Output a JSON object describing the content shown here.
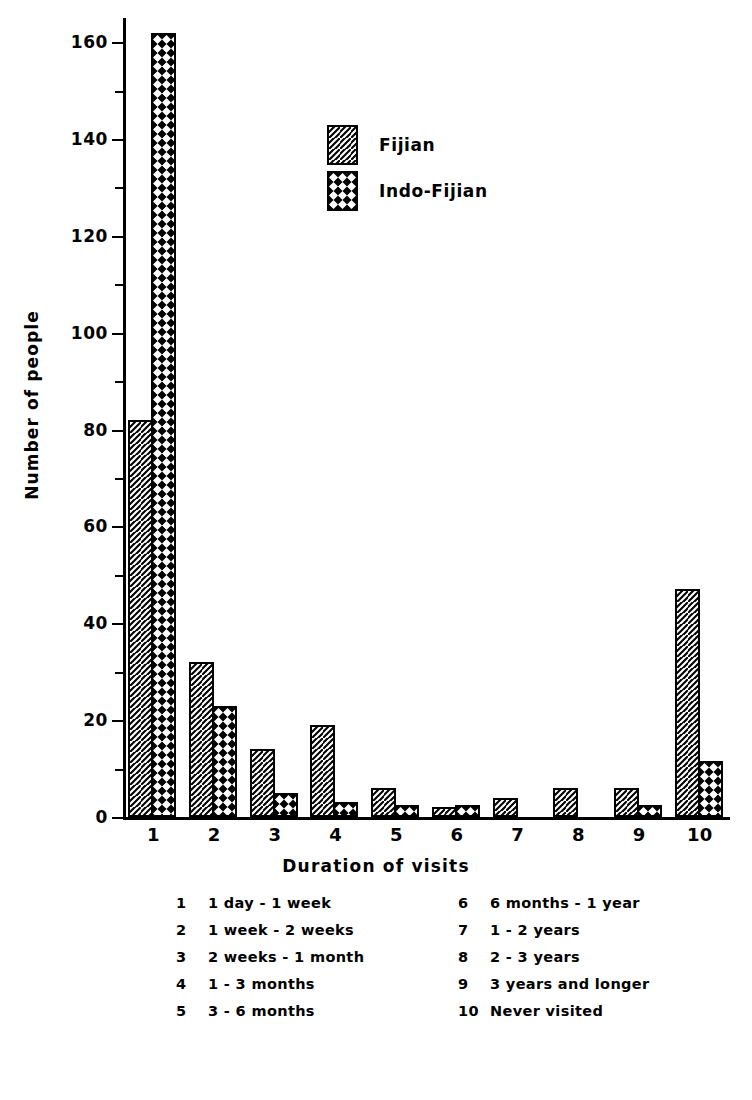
{
  "chart_data": {
    "type": "bar",
    "title": "",
    "xlabel": "Duration of visits",
    "ylabel": "Number of people",
    "categories": [
      "1",
      "2",
      "3",
      "4",
      "5",
      "6",
      "7",
      "8",
      "9",
      "10"
    ],
    "ylim": [
      0,
      165
    ],
    "ytick_labels": [
      "0",
      "20",
      "40",
      "60",
      "80",
      "100",
      "120",
      "140",
      "160"
    ],
    "ytick_values": [
      0,
      20,
      40,
      60,
      80,
      100,
      120,
      140,
      160
    ],
    "yminor_values": [
      10,
      30,
      50,
      70,
      90,
      110,
      130,
      150
    ],
    "grid": false,
    "legend_position": "upper-center",
    "series": [
      {
        "name": "Fijian",
        "values": [
          82,
          32,
          14,
          19,
          6,
          2,
          4,
          6,
          6,
          47
        ]
      },
      {
        "name": "Indo-Fijian",
        "values": [
          162,
          23,
          5,
          3,
          2.5,
          2.5,
          0,
          0,
          2.5,
          11.5
        ]
      }
    ],
    "category_key": [
      {
        "num": "1",
        "desc": "1 day - 1 week"
      },
      {
        "num": "2",
        "desc": "1 week - 2 weeks"
      },
      {
        "num": "3",
        "desc": "2 weeks - 1 month"
      },
      {
        "num": "4",
        "desc": "1 - 3 months"
      },
      {
        "num": "5",
        "desc": "3 - 6 months"
      },
      {
        "num": "6",
        "desc": "6 months - 1 year"
      },
      {
        "num": "7",
        "desc": "1 - 2 years"
      },
      {
        "num": "8",
        "desc": "2 - 3 years"
      },
      {
        "num": "9",
        "desc": "3 years and longer"
      },
      {
        "num": "10",
        "desc": "Never visited"
      }
    ],
    "colors": {
      "ink": "#000000",
      "background": "#ffffff"
    }
  }
}
